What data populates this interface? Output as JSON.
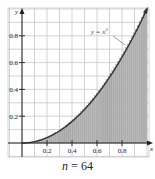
{
  "chart_data": {
    "type": "area",
    "title": "",
    "function_label": "y = x²",
    "function": "x^2",
    "n_rectangles": 64,
    "caption": "n = 64",
    "xlabel": "x",
    "ylabel": "y",
    "xlim": [
      -0.1,
      1.0
    ],
    "ylim": [
      -0.1,
      1.0
    ],
    "x_ticks": [
      0.2,
      0.4,
      0.6,
      0.8
    ],
    "x_tick_labels": [
      "0.2",
      "0.4",
      "0.6",
      "0.8"
    ],
    "y_ticks": [
      0.2,
      0.4,
      0.6,
      0.8
    ],
    "y_tick_labels": [
      "0.2",
      "0.4",
      "0.6",
      "0.8"
    ],
    "grid": true,
    "grid_step": 0.1,
    "colors": {
      "fill": "#b8b8b8",
      "rect_line": "#8a8a8a",
      "curve": "#333333",
      "grid": "#c8c8c8",
      "axis": "#222222"
    }
  },
  "caption": {
    "prefix": "n",
    "suffix": " = 64"
  }
}
